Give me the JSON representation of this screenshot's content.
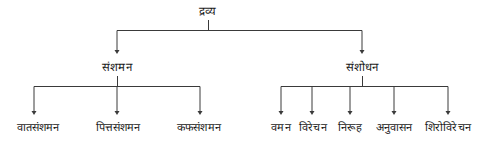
{
  "diagram": {
    "type": "hierarchy-tree",
    "title": "द्रव्य",
    "stroke_color": "#3a3a3a",
    "text_color": "#1a1a1a",
    "background_color": "#ffffff",
    "root": {
      "label": "द्रव्य",
      "x": 208,
      "y": 16
    },
    "level1": [
      {
        "label": "संशमन",
        "x": 117,
        "y": 72
      },
      {
        "label": "संशोधन",
        "x": 362,
        "y": 72
      }
    ],
    "level2_left": [
      {
        "label": "वातसंशमन",
        "x": 38,
        "y": 133
      },
      {
        "label": "पित्तसंशमन",
        "x": 118,
        "y": 133
      },
      {
        "label": "कफसंशमन",
        "x": 199,
        "y": 133
      }
    ],
    "level2_right": [
      {
        "label": "वमन",
        "x": 281,
        "y": 133
      },
      {
        "label": "विरेचन",
        "x": 312,
        "y": 133
      },
      {
        "label": "निरूह",
        "x": 350,
        "y": 133
      },
      {
        "label": "अनुवासन",
        "x": 394,
        "y": 133
      },
      {
        "label": "शिरोविरेचन",
        "x": 448,
        "y": 133
      }
    ],
    "connectors": {
      "root_stem": {
        "x": 208,
        "y1": 20,
        "y2": 30
      },
      "root_bar": {
        "x1": 117,
        "x2": 362,
        "y": 30
      },
      "root_drops_to": 54,
      "left_stem": {
        "x": 117,
        "y1": 76,
        "y2": 86
      },
      "left_bar": {
        "x1": 34,
        "x2": 200,
        "y": 86
      },
      "right_stem": {
        "x": 362,
        "y1": 76,
        "y2": 86
      },
      "right_bar": {
        "x1": 281,
        "x2": 448,
        "y": 86
      },
      "leaf_drops_to": 115
    }
  }
}
